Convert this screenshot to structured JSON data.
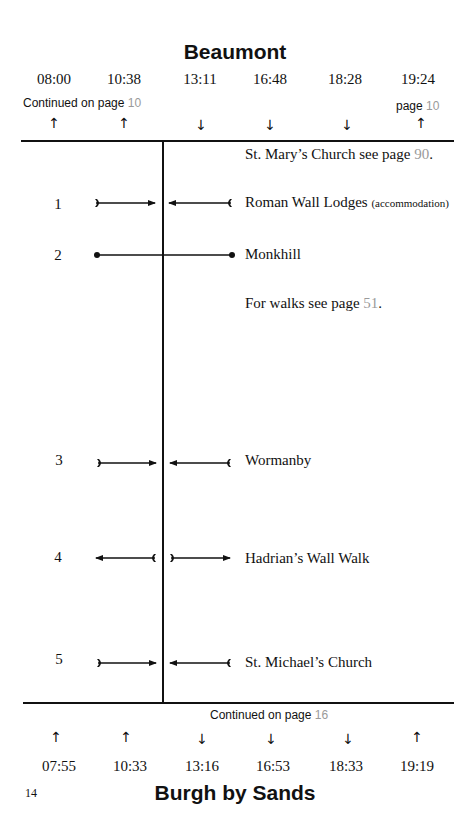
{
  "top_stop": {
    "name": "Beaumont",
    "times": [
      "08:00",
      "10:38",
      "13:11",
      "16:48",
      "18:28",
      "19:24"
    ],
    "directions": [
      "up-arrow",
      "up-arrow",
      "down-arrow",
      "down-arrow",
      "down-arrow",
      "up-arrow"
    ],
    "direction_glyphs": [
      "↑",
      "↑",
      "↓",
      "↓",
      "↓",
      "↑"
    ],
    "continued_left": {
      "text": "Continued on page",
      "page": "10"
    },
    "continued_right": {
      "text": "page",
      "page": "10"
    }
  },
  "header_note": {
    "text": "St. Mary’s Church see page",
    "page": "90",
    "suffix": "."
  },
  "route_points": [
    {
      "number": "1",
      "label": "Roman Wall Lodges",
      "sub": "(accommodation)",
      "connector": "arrows-inward"
    },
    {
      "number": "2",
      "label": "Monkhill",
      "sub": "",
      "connector": "through-line"
    },
    {
      "number": "3",
      "label": "Wormanby",
      "sub": "",
      "connector": "arrows-inward"
    },
    {
      "number": "4",
      "label": "Hadrian’s Wall Walk",
      "sub": "",
      "connector": "arrows-outward"
    },
    {
      "number": "5",
      "label": "St. Michael’s Church",
      "sub": "",
      "connector": "arrows-inward"
    }
  ],
  "walks_note": {
    "text": "For walks see page",
    "page": "51",
    "suffix": "."
  },
  "bottom_stop": {
    "name": "Burgh by Sands",
    "times": [
      "07:55",
      "10:33",
      "13:16",
      "16:53",
      "18:33",
      "19:19"
    ],
    "directions": [
      "up-arrow",
      "up-arrow",
      "down-arrow",
      "down-arrow",
      "down-arrow",
      "up-arrow"
    ],
    "direction_glyphs": [
      "↑",
      "↑",
      "↓",
      "↓",
      "↓",
      "↑"
    ],
    "continued": {
      "text": "Continued on page",
      "page": "16"
    }
  },
  "page_number": "14",
  "colors": {
    "text": "#111111",
    "page_ref": "#9a9a9a",
    "background": "#ffffff"
  }
}
